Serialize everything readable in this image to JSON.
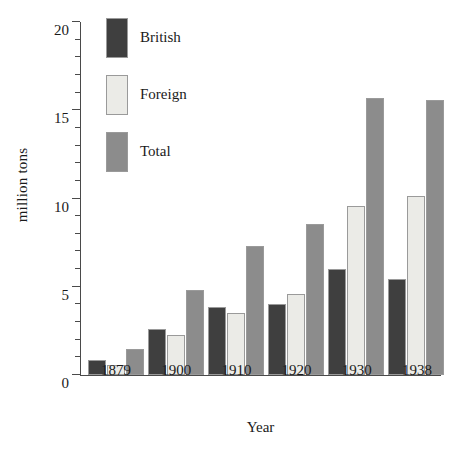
{
  "chart_data": {
    "type": "bar",
    "title": "",
    "xlabel": "Year",
    "ylabel": "million tons",
    "categories": [
      "1879",
      "1900",
      "1910",
      "1920",
      "1930",
      "1938"
    ],
    "series": [
      {
        "name": "British",
        "color": "#3f3f3f",
        "values": [
          0.85,
          2.6,
          3.85,
          4.0,
          6.0,
          5.45
        ]
      },
      {
        "name": "Foreign",
        "color": "#ebebe7",
        "values": [
          0.55,
          2.25,
          3.5,
          4.6,
          9.6,
          10.15
        ]
      },
      {
        "name": "Total",
        "color": "#8c8c8c",
        "values": [
          1.45,
          4.8,
          7.3,
          8.55,
          15.7,
          15.6
        ]
      }
    ],
    "ylim": [
      0,
      20
    ],
    "ytick_labels": [
      "0",
      "5",
      "10",
      "15",
      "20"
    ],
    "ytick_values": [
      0,
      5,
      10,
      15,
      20
    ],
    "yminor_step": 1,
    "grid": false,
    "legend_position": "top-left",
    "axis_color": "#4a4a4a"
  }
}
